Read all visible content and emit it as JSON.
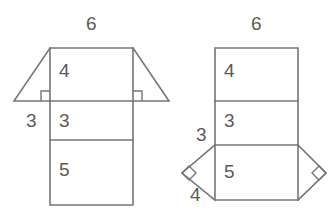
{
  "figure": {
    "stroke_color": "#767676",
    "label_color": "#5a5a5a",
    "background_color": "#ffffff"
  },
  "left_figure": {
    "name": "trapezoid-over-rectangle-net",
    "labels": {
      "top_width": "6",
      "upper_band": "4",
      "middle_band": "3",
      "lower_band": "5",
      "left_base": "3"
    }
  },
  "right_figure": {
    "name": "rectangle-with-side-triangles-net",
    "labels": {
      "top_width": "6",
      "upper_band": "4",
      "middle_band": "3",
      "lower_band": "5",
      "triangle_top": "3",
      "triangle_bottom": "4"
    }
  }
}
